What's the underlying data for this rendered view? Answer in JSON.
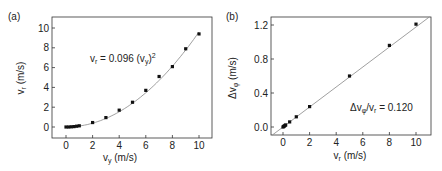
{
  "chart_data": [
    {
      "panel_label": "(a)",
      "type": "scatter",
      "xlabel": "v_y (m/s)",
      "ylabel": "v_r (m/s)",
      "xlim": [
        -1,
        11
      ],
      "ylim": [
        -1,
        11
      ],
      "xticks": [
        0,
        2,
        4,
        6,
        8,
        10
      ],
      "yticks": [
        0,
        2,
        4,
        6,
        8,
        10
      ],
      "grid": false,
      "annotation": "v_r = 0.096 (v_y)^2",
      "fit": {
        "type": "quadratic",
        "coefficient": 0.096
      },
      "series": [
        {
          "name": "data",
          "x": [
            0,
            0.2,
            0.4,
            0.6,
            0.8,
            1.0,
            2,
            3,
            4,
            5,
            6,
            7,
            8,
            9,
            10
          ],
          "y": [
            0.0,
            0.0,
            0.02,
            0.04,
            0.08,
            0.12,
            0.45,
            0.95,
            1.7,
            2.5,
            3.7,
            5.1,
            6.1,
            7.9,
            9.4
          ]
        }
      ]
    },
    {
      "panel_label": "(b)",
      "type": "scatter",
      "xlabel": "v_r (m/s)",
      "ylabel": "Δv_φ (m/s)",
      "xlim": [
        -0.8,
        11
      ],
      "ylim": [
        -0.1,
        1.32
      ],
      "xticks": [
        0,
        2,
        4,
        6,
        8,
        10
      ],
      "yticks": [
        0.0,
        0.4,
        0.8,
        1.2
      ],
      "grid": false,
      "annotation": "Δv_φ/v_r = 0.120",
      "fit": {
        "type": "linear",
        "slope": 0.12
      },
      "series": [
        {
          "name": "data",
          "x": [
            0,
            0.05,
            0.1,
            0.15,
            0.2,
            0.5,
            1,
            2,
            5,
            8,
            10
          ],
          "y": [
            0.0,
            0.006,
            0.012,
            0.018,
            0.024,
            0.06,
            0.12,
            0.24,
            0.6,
            0.96,
            1.21
          ]
        }
      ]
    }
  ],
  "labels": {
    "a": {
      "panel": "(a)",
      "x_main": "v",
      "x_sub": "y",
      "x_unit": " (m/s)",
      "y_main": "v",
      "y_sub": "r",
      "y_unit": " (m/s)",
      "eq_lhs_main": "v",
      "eq_lhs_sub": "r",
      "eq_mid": " = 0.096 (v",
      "eq_sub2": "y",
      "eq_end": ")",
      "eq_sup": "2",
      "xticks": [
        "0",
        "2",
        "4",
        "6",
        "8",
        "10"
      ],
      "yticks": [
        "0",
        "2",
        "4",
        "6",
        "8",
        "10"
      ]
    },
    "b": {
      "panel": "(b)",
      "x_main": "v",
      "x_sub": "r",
      "x_unit": " (m/s)",
      "y_main": "Δv",
      "y_sub": "φ",
      "y_unit": " (m/s)",
      "eq_a": "Δv",
      "eq_a_sub": "φ",
      "eq_b": "/v",
      "eq_b_sub": "r",
      "eq_c": " = 0.120",
      "xticks": [
        "0",
        "2",
        "4",
        "6",
        "8",
        "10"
      ],
      "yticks": [
        "0.0",
        "0.4",
        "0.8",
        "1.2"
      ]
    }
  }
}
